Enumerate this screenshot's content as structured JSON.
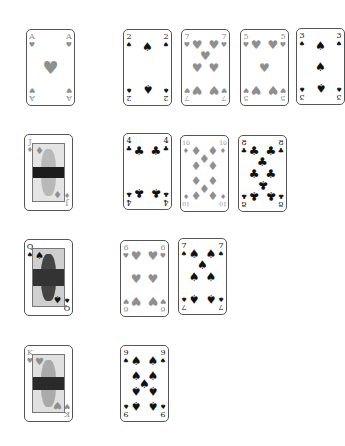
{
  "colors": {
    "red_suit": "#8f8f8f",
    "black_suit": "#111111",
    "card_border": "#555555",
    "background": "#ffffff"
  },
  "suits": {
    "hearts": "♥",
    "diamonds": "♦",
    "spades": "♠",
    "clubs": "♣"
  },
  "rows": [
    {
      "column_card": {
        "rank": "A",
        "suit": "hearts",
        "suit_symbol": "♥",
        "color": "red"
      },
      "cards": [
        {
          "rank": "2",
          "suit": "spades",
          "suit_symbol": "♠",
          "color": "black"
        },
        {
          "rank": "7",
          "suit": "hearts",
          "suit_symbol": "♥",
          "color": "red"
        },
        {
          "rank": "5",
          "suit": "hearts",
          "suit_symbol": "♥",
          "color": "red"
        },
        {
          "rank": "3",
          "suit": "spades",
          "suit_symbol": "♠",
          "color": "black"
        }
      ]
    },
    {
      "column_card": {
        "rank": "J",
        "suit": "diamonds",
        "suit_symbol": "♦",
        "color": "red"
      },
      "cards": [
        {
          "rank": "4",
          "suit": "clubs",
          "suit_symbol": "♣",
          "color": "black"
        },
        {
          "rank": "10",
          "suit": "diamonds",
          "suit_symbol": "♦",
          "color": "red"
        },
        {
          "rank": "8",
          "suit": "clubs",
          "suit_symbol": "♣",
          "color": "black"
        }
      ]
    },
    {
      "column_card": {
        "rank": "Q",
        "suit": "spades",
        "suit_symbol": "♠",
        "color": "black"
      },
      "cards": [
        {
          "rank": "6",
          "suit": "hearts",
          "suit_symbol": "♥",
          "color": "red"
        },
        {
          "rank": "7",
          "suit": "spades",
          "suit_symbol": "♠",
          "color": "black"
        }
      ]
    },
    {
      "column_card": {
        "rank": "K",
        "suit": "hearts",
        "suit_symbol": "♥",
        "color": "red"
      },
      "cards": [
        {
          "rank": "9",
          "suit": "spades",
          "suit_symbol": "♠",
          "color": "black"
        }
      ]
    }
  ]
}
